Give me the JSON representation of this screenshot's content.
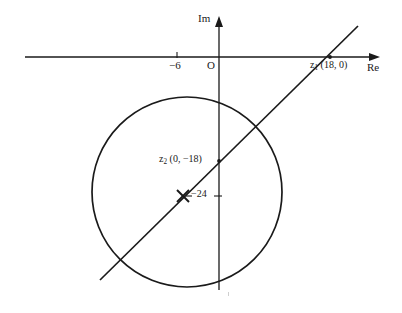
{
  "figure": {
    "background_color": "#ffffff",
    "stroke_color": "#1a1a1a",
    "width": 402,
    "height": 313
  },
  "axes": {
    "imaginary_axis_label": "Im",
    "real_axis_label": "Re",
    "origin_label": "O",
    "origin_px": {
      "x": 219,
      "y": 57
    },
    "real_axis": {
      "x1": 25,
      "y1": 57,
      "x2": 380,
      "y2": 57,
      "arrow": "right"
    },
    "imaginary_axis": {
      "x1": 219,
      "y1": 17,
      "x2": 219,
      "y2": 290,
      "arrow": "up"
    }
  },
  "ticks": [
    {
      "name": "tick-minus-6",
      "label": "−6",
      "axis": "real",
      "px": {
        "x": 177,
        "y": 57
      }
    },
    {
      "name": "tick-minus-24",
      "label": "−24",
      "axis": "imaginary",
      "px": {
        "x": 219,
        "y": 196
      }
    }
  ],
  "points": [
    {
      "name": "z1",
      "label": "z₁ (18, 0)",
      "symbol": "z",
      "subscript": "1",
      "coords": "(18, 0)",
      "px": {
        "x": 330,
        "y": 57
      }
    },
    {
      "name": "z2",
      "label": "z₂ (0, −18)",
      "symbol": "z",
      "subscript": "2",
      "coords": "(0, −18)",
      "px": {
        "x": 219,
        "y": 161
      }
    },
    {
      "name": "circle-centre-cross",
      "label": "",
      "marker": "x-cross",
      "px": {
        "x": 183,
        "y": 196
      }
    }
  ],
  "circle": {
    "centre_px": {
      "x": 187,
      "y": 192
    },
    "radius_px": 95,
    "stroke_width": 1.6
  },
  "line": {
    "name": "chord-through-z1-z2",
    "from_px": {
      "x": 100,
      "y": 280
    },
    "to_px": {
      "x": 358,
      "y": 26
    },
    "stroke_width": 1.6
  }
}
